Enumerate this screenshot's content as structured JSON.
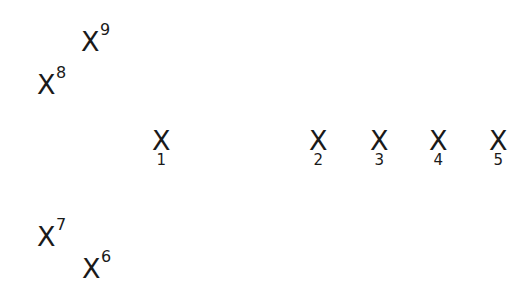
{
  "diagram": {
    "marker_glyph": "X",
    "row_markers": [
      {
        "id": "1",
        "label": "1",
        "x": 152,
        "y": 127
      },
      {
        "id": "2",
        "label": "2",
        "x": 309,
        "y": 127
      },
      {
        "id": "3",
        "label": "3",
        "x": 370,
        "y": 127
      },
      {
        "id": "4",
        "label": "4",
        "x": 429,
        "y": 127
      },
      {
        "id": "5",
        "label": "5",
        "x": 489,
        "y": 127
      }
    ],
    "offset_markers": [
      {
        "id": "6",
        "label": "6",
        "x": 82,
        "y": 255
      },
      {
        "id": "7",
        "label": "7",
        "x": 37,
        "y": 223
      },
      {
        "id": "8",
        "label": "8",
        "x": 37,
        "y": 71
      },
      {
        "id": "9",
        "label": "9",
        "x": 81,
        "y": 28
      }
    ]
  }
}
